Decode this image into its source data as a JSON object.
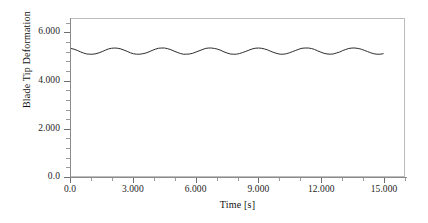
{
  "chart_data": {
    "type": "line",
    "title": "",
    "xlabel": "Time [s]",
    "ylabel": "Blade Tip Deformation",
    "xlim": [
      0.0,
      16.0
    ],
    "ylim": [
      0.0,
      6.6
    ],
    "grid": false,
    "legend": null,
    "x_ticks": [
      {
        "value": 0.0,
        "label": "0.0"
      },
      {
        "value": 3.0,
        "label": "3.000"
      },
      {
        "value": 6.0,
        "label": "6.000"
      },
      {
        "value": 9.0,
        "label": "9.000"
      },
      {
        "value": 12.0,
        "label": "12.000"
      },
      {
        "value": 15.0,
        "label": "15.000"
      }
    ],
    "y_ticks": [
      {
        "value": 0.0,
        "label": "0.0"
      },
      {
        "value": 2.0,
        "label": "2.000"
      },
      {
        "value": 4.0,
        "label": "4.000"
      },
      {
        "value": 6.0,
        "label": "6.000"
      }
    ],
    "x_minor_ticks_per_interval": 2,
    "y_minor_ticks_per_interval": 4,
    "series": [
      {
        "name": "Blade Tip Deformation",
        "color": "#2b2b2b",
        "line_width": 1.0,
        "mean": 5.25,
        "amplitude": 0.13,
        "period": 2.1,
        "x": [
          0.0,
          0.15,
          0.3,
          0.45,
          0.6,
          0.75,
          0.9,
          1.05,
          1.2,
          1.35,
          1.5,
          1.65,
          1.8,
          1.95,
          2.1,
          2.25,
          2.4,
          2.55,
          2.7,
          2.85,
          3.0,
          3.15,
          3.3,
          3.45,
          3.6,
          3.75,
          3.9,
          4.05,
          4.2,
          4.35,
          4.5,
          4.65,
          4.8,
          4.95,
          5.1,
          5.25,
          5.4,
          5.55,
          5.7,
          5.85,
          6.0,
          6.15,
          6.3,
          6.45,
          6.6,
          6.75,
          6.9,
          7.05,
          7.2,
          7.35,
          7.5,
          7.65,
          7.8,
          7.95,
          8.1,
          8.25,
          8.4,
          8.55,
          8.7,
          8.85,
          9.0,
          9.15,
          9.3,
          9.45,
          9.6,
          9.75,
          9.9,
          10.05,
          10.2,
          10.35,
          10.5,
          10.65,
          10.8,
          10.95,
          11.1,
          11.25,
          11.4,
          11.55,
          11.7,
          11.85,
          12.0,
          12.15,
          12.3,
          12.45,
          12.6,
          12.75,
          12.9,
          13.05,
          13.2,
          13.35,
          13.5,
          13.65,
          13.8,
          13.95,
          14.1,
          14.25,
          14.4,
          14.55,
          14.7,
          14.85,
          15.0
        ],
        "y": [
          5.36,
          5.33,
          5.28,
          5.22,
          5.17,
          5.13,
          5.12,
          5.12,
          5.14,
          5.18,
          5.23,
          5.29,
          5.34,
          5.37,
          5.38,
          5.37,
          5.34,
          5.29,
          5.24,
          5.18,
          5.14,
          5.12,
          5.12,
          5.14,
          5.17,
          5.22,
          5.28,
          5.33,
          5.37,
          5.38,
          5.38,
          5.35,
          5.31,
          5.25,
          5.2,
          5.15,
          5.12,
          5.12,
          5.13,
          5.16,
          5.21,
          5.26,
          5.31,
          5.36,
          5.38,
          5.38,
          5.36,
          5.33,
          5.28,
          5.22,
          5.17,
          5.13,
          5.12,
          5.12,
          5.15,
          5.19,
          5.24,
          5.29,
          5.34,
          5.37,
          5.38,
          5.37,
          5.34,
          5.3,
          5.24,
          5.19,
          5.15,
          5.12,
          5.12,
          5.14,
          5.18,
          5.23,
          5.28,
          5.33,
          5.37,
          5.38,
          5.38,
          5.36,
          5.32,
          5.26,
          5.21,
          5.16,
          5.13,
          5.12,
          5.13,
          5.17,
          5.21,
          5.27,
          5.32,
          5.36,
          5.38,
          5.38,
          5.36,
          5.33,
          5.28,
          5.23,
          5.18,
          5.14,
          5.12,
          5.12,
          5.14
        ]
      }
    ]
  },
  "axis": {
    "y_title": "Blade Tip Deformation",
    "x_title": "Time [s]"
  }
}
